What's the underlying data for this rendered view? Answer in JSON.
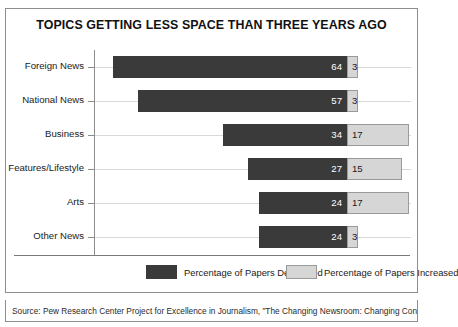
{
  "chart_data": {
    "type": "bar",
    "subtype": "diverging-stacked-bar",
    "title": "TOPICS GETTING LESS SPACE THAN THREE YEARS AGO",
    "xlabel": "",
    "ylabel": "",
    "grid": true,
    "legend_position": "bottom",
    "categories": [
      "Foreign News",
      "National News",
      "Business",
      "Features/Lifestyle",
      "Arts",
      "Other News"
    ],
    "series": [
      {
        "name": "Percentage of Papers Decreased",
        "color": "#3a3a3a",
        "values": [
          64,
          57,
          34,
          27,
          24,
          24
        ]
      },
      {
        "name": "Percentage of Papers Increased",
        "color": "#d6d6d6",
        "values": [
          3,
          3,
          17,
          15,
          17,
          3
        ]
      }
    ],
    "value_labels": {
      "decreased": [
        "64",
        "57",
        "34",
        "27",
        "24",
        "24"
      ],
      "increased": [
        "3",
        "3",
        "17",
        "15",
        "17",
        "3"
      ]
    },
    "axis_max": 70
  },
  "legend": {
    "items": [
      {
        "label": "Percentage of Papers Decreased",
        "swatch": "dark"
      },
      {
        "label": "Percentage of Papers Increased",
        "swatch": "light"
      }
    ]
  },
  "source": {
    "text": "Source: Pew Research Center Project for Excellence in Journalism, \"The Changing Newsroom: Changing Content,\""
  },
  "colors": {
    "decreased": "#3a3a3a",
    "increased": "#d6d6d6",
    "frame": "#8d8d8d",
    "grid": "#d9d9d9",
    "background": "#ffffff"
  }
}
